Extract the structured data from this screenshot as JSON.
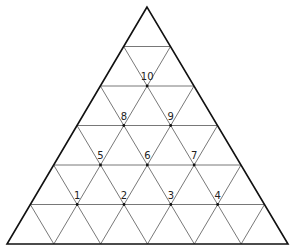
{
  "diagram": {
    "type": "triangular-grid",
    "subdivisions": 6,
    "triangle": {
      "apex": [
        147,
        7
      ],
      "base_left": [
        7,
        244
      ],
      "base_right": [
        288,
        244
      ]
    },
    "colors": {
      "outline": "#111111",
      "grid": "#555555",
      "label": "#222222",
      "background": "#ffffff"
    },
    "points": [
      {
        "label": "1",
        "row": 5,
        "col": 1
      },
      {
        "label": "2",
        "row": 5,
        "col": 2
      },
      {
        "label": "3",
        "row": 5,
        "col": 3
      },
      {
        "label": "4",
        "row": 5,
        "col": 4
      },
      {
        "label": "5",
        "row": 4,
        "col": 1
      },
      {
        "label": "6",
        "row": 4,
        "col": 2
      },
      {
        "label": "7",
        "row": 4,
        "col": 3
      },
      {
        "label": "8",
        "row": 3,
        "col": 1
      },
      {
        "label": "9",
        "row": 3,
        "col": 2
      },
      {
        "label": "10",
        "row": 2,
        "col": 1
      }
    ]
  }
}
